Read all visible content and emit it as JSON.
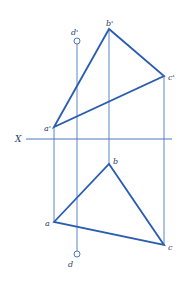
{
  "diagram": {
    "type": "orthographic-projection",
    "colors": {
      "projection_line": "#4a78c0",
      "triangle_edge": "#2a5db0",
      "axis": "#4a78c0",
      "label": "#2a3a6a",
      "background": "#ffffff"
    },
    "axis": {
      "label": "X",
      "y": 139,
      "x_start": 26,
      "x_end": 172
    },
    "front_view": {
      "points": [
        {
          "name": "a'",
          "x": 54,
          "y": 127
        },
        {
          "name": "b'",
          "x": 109,
          "y": 29
        },
        {
          "name": "c'",
          "x": 164,
          "y": 76
        }
      ],
      "point_d": {
        "name": "d'",
        "x": 77,
        "y": 41
      }
    },
    "top_view": {
      "points": [
        {
          "name": "a",
          "x": 54,
          "y": 222
        },
        {
          "name": "b",
          "x": 109,
          "y": 164
        },
        {
          "name": "c",
          "x": 164,
          "y": 245
        }
      ],
      "point_d": {
        "name": "d",
        "x": 77,
        "y": 254
      }
    },
    "labels": {
      "a_prime": "a'",
      "b_prime": "b'",
      "c_prime": "c'",
      "d_prime": "d'",
      "a": "a",
      "b": "b",
      "c": "c",
      "d": "d",
      "x_axis": "X"
    }
  }
}
